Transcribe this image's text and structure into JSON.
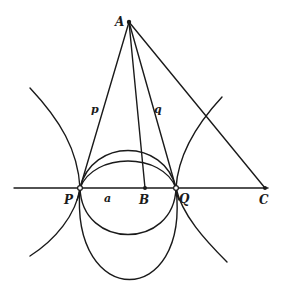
{
  "figure": {
    "type": "geometric diagram",
    "labels": {
      "A": "A",
      "B": "B",
      "C": "C",
      "P": "P",
      "Q": "Q",
      "p": "p",
      "q": "q",
      "a": "a"
    },
    "points": {
      "A": [
        129,
        22
      ],
      "P": [
        80,
        188
      ],
      "B": [
        145,
        188
      ],
      "Q": [
        176,
        188
      ],
      "C": [
        265,
        188
      ]
    },
    "colors": {
      "ink": "#1a1a1a",
      "paper": "#ffffff"
    }
  }
}
